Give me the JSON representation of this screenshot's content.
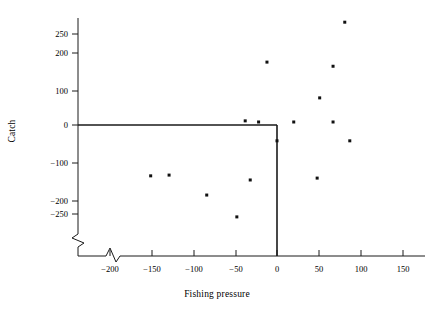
{
  "figure": {
    "background_color": "#ffffff",
    "axis_color": "#1a1a1a",
    "marker_color": "#111111"
  },
  "axes": {
    "x_title": "Fishing pressure",
    "y_title": "Catch",
    "x_tick_labels": [
      "−200",
      "−150",
      "−100",
      "−50",
      "0",
      "50",
      "100",
      "150"
    ],
    "y_tick_labels": [
      "250",
      "200",
      "100",
      "0",
      "−100",
      "−200",
      "−250"
    ]
  },
  "chart_data": {
    "type": "scatter",
    "title": "",
    "xlabel": "Fishing pressure",
    "ylabel": "Catch",
    "xlim": [
      -250,
      190
    ],
    "ylim": [
      -290,
      290
    ],
    "grid": false,
    "legend": null,
    "axis_break": {
      "x_axis": true,
      "y_axis": true,
      "note": "zigzag break symbols near lower-left corner on both axes"
    },
    "reference_lines": [
      {
        "name": "zero-catch-line",
        "orientation": "horizontal",
        "value": 0,
        "x_from": -238,
        "x_to": 0
      },
      {
        "name": "zero-pressure-line",
        "orientation": "vertical",
        "value": 0,
        "y_from": 0,
        "y_to": -348
      }
    ],
    "x_ticks": [
      -200,
      -150,
      -100,
      -50,
      0,
      50,
      100,
      150
    ],
    "y_ticks": [
      250,
      200,
      100,
      0,
      -100,
      -200,
      -250
    ],
    "points": [
      {
        "x": -151,
        "y": -135
      },
      {
        "x": -129,
        "y": -133
      },
      {
        "x": -84,
        "y": -186
      },
      {
        "x": -48,
        "y": -244
      },
      {
        "x": -38,
        "y": 11
      },
      {
        "x": -32,
        "y": -146
      },
      {
        "x": -22,
        "y": 8
      },
      {
        "x": -12,
        "y": 167
      },
      {
        "x": 0,
        "y": -42
      },
      {
        "x": 20,
        "y": 8
      },
      {
        "x": 48,
        "y": -141
      },
      {
        "x": 51,
        "y": 72
      },
      {
        "x": 67,
        "y": 8
      },
      {
        "x": 67,
        "y": 156
      },
      {
        "x": 81,
        "y": 273
      },
      {
        "x": 87,
        "y": -42
      }
    ]
  }
}
